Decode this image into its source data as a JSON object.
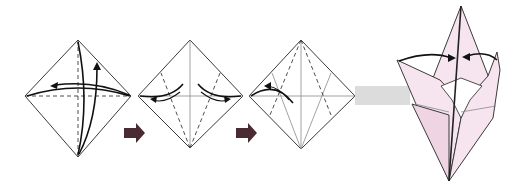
{
  "diagram": {
    "title": "",
    "type": "origami-folding-sequence",
    "colors": {
      "paper": "#ffffff",
      "paper_colored_side": "#f6e4ee",
      "paper_colored_shade": "#efd4e3",
      "step_arrow": "#4a2a33",
      "transition_band": "#dcdcdc",
      "line": "#3a3a3a"
    },
    "steps": [
      {
        "index": 1,
        "shape": "square-diamond",
        "lines": [
          "horizontal valley fold (dashed)",
          "vertical valley fold (dashed)"
        ],
        "arrows": [
          "fold left corner to right and unfold",
          "fold bottom corner to top and unfold"
        ]
      },
      {
        "index": 2,
        "shape": "square-diamond",
        "lines": [
          "horizontal crease",
          "vertical crease",
          "two dashed valley lines from bottom corner toward upper edges"
        ],
        "arrows": [
          "fold left edge to center and unfold",
          "fold right edge to center and unfold"
        ]
      },
      {
        "index": 3,
        "shape": "square-diamond",
        "lines": [
          "creases from previous step",
          "two dashed valley lines from top corner"
        ],
        "arrows": [
          "fold and unfold on left side"
        ]
      },
      {
        "index": 4,
        "shape": "3D-folded-model",
        "lines": [
          "center spine",
          "inner pocket opening"
        ],
        "arrows": [
          "bring left flap to center",
          "bring right flap to center"
        ]
      }
    ],
    "transitions": [
      {
        "from": 1,
        "to": 2,
        "symbol": "right-arrow"
      },
      {
        "from": 2,
        "to": 3,
        "symbol": "right-arrow"
      },
      {
        "from": 3,
        "to": 4,
        "symbol": "gray-band"
      }
    ]
  }
}
